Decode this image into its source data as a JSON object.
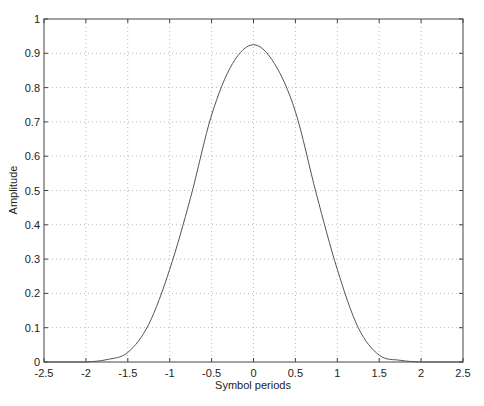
{
  "chart_data": {
    "type": "line",
    "title": "",
    "xlabel": "Symbol periods",
    "ylabel": "Amplitude",
    "xlim": [
      -2.5,
      2.5
    ],
    "ylim": [
      0,
      1
    ],
    "grid": true,
    "legend": null,
    "x_ticks": [
      -2.5,
      -2,
      -1.5,
      -1,
      -0.5,
      0,
      0.5,
      1,
      1.5,
      2,
      2.5
    ],
    "x_tick_labels": [
      "-2.5",
      "-2",
      "-1.5",
      "-1",
      "-0.5",
      "0",
      "0.5",
      "1",
      "1.5",
      "2",
      "2.5"
    ],
    "y_ticks": [
      0,
      0.1,
      0.2,
      0.3,
      0.4,
      0.5,
      0.6,
      0.7,
      0.8,
      0.9,
      1
    ],
    "y_tick_labels": [
      "0",
      "0.1",
      "0.2",
      "0.3",
      "0.4",
      "0.5",
      "0.6",
      "0.7",
      "0.8",
      "0.9",
      "1"
    ],
    "series": [
      {
        "name": "pulse",
        "color": "#555555",
        "x": [
          -2.5,
          -2.25,
          -2,
          -1.75,
          -1.5,
          -1.25,
          -1,
          -0.75,
          -0.5,
          -0.25,
          0,
          0.25,
          0.5,
          0.75,
          1,
          1.25,
          1.5,
          1.75,
          2,
          2.25,
          2.5
        ],
        "y": [
          0,
          0,
          0,
          0.007,
          0.028,
          0.11,
          0.27,
          0.48,
          0.72,
          0.87,
          0.925,
          0.87,
          0.73,
          0.49,
          0.27,
          0.1,
          0.02,
          0.005,
          0,
          0,
          0
        ]
      }
    ]
  }
}
